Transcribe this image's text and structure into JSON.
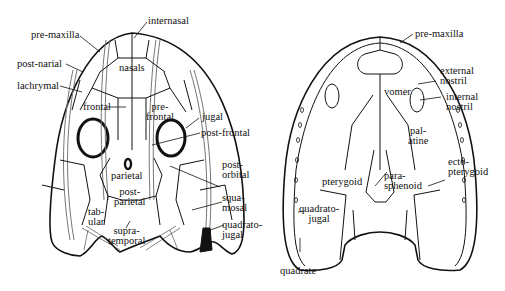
{
  "dorsal_view": {
    "labels": {
      "internasal": "internasal",
      "pre_maxilla": "pre-maxilla",
      "post_narial": "post-narial",
      "lachrymal": "lachrymal",
      "nasals": "nasals",
      "frontal": "frontal",
      "pre_frontal": "pre-\nfrontal",
      "jugal": "jugal",
      "post_frontal": "post-frontal",
      "post_orbital": "post-\norbital",
      "parietal": "parietal",
      "post_parietal": "post-\nparietal",
      "squamosal": "squa-\nmosal",
      "tabular": "tab-\nular",
      "quadrato_jugal": "quadrato-\njugal",
      "supra_temporal": "supra-\ntemporal"
    }
  },
  "palatal_view": {
    "labels": {
      "pre_maxilla": "pre-maxilla",
      "external_nostril": "external\nnostril",
      "internal_nostril": "internal\nnostril",
      "vomer": "vomer",
      "palatine": "pal-\natine",
      "ecto_pterygoid": "ecto-\npterygoid",
      "pterygoid": "pterygoid",
      "para_sphenoid": "para-\nsphenoid",
      "quadrato_jugal": "quadrato-\njugal",
      "quadrate": "quadrate"
    }
  }
}
